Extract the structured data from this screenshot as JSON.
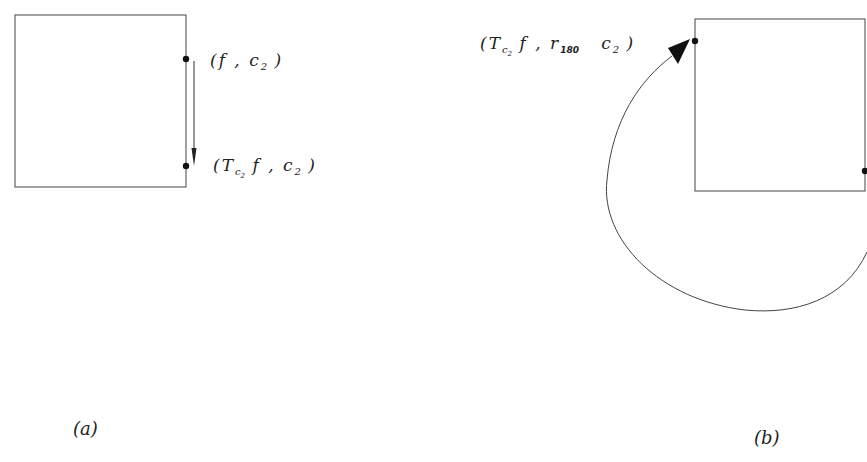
{
  "diagram": {
    "panel_a": {
      "caption": "(a)",
      "label_top": {
        "open": "(",
        "f": "f",
        "sep": " ,  ",
        "c": "c",
        "c_sub": "2",
        "close": ")"
      },
      "label_bottom": {
        "open": "(",
        "T": "T",
        "T_sub_c": "c",
        "T_sub_2": "2",
        "f": " f",
        "sep": " ,  ",
        "c": "c",
        "c_sub": "2",
        "close": ")"
      },
      "description": "Square with two points on right edge; downward arrow from (f, c2) to (T_c2 f, c2)"
    },
    "panel_b": {
      "caption": "(b)",
      "label_top": {
        "open": "(",
        "T": "T",
        "T_sub_c": "c",
        "T_sub_2": "2",
        "f": " f",
        "sep": " ,  ",
        "r": "r",
        "r_sub": "180",
        "c": "c",
        "c_sub": "2",
        "close": ")"
      },
      "description": "Square with a point at lower right edge; curved arrow rotates 180 degrees around to upper-left point"
    },
    "colors": {
      "stroke": "#333333",
      "background": "#ffffff"
    }
  }
}
